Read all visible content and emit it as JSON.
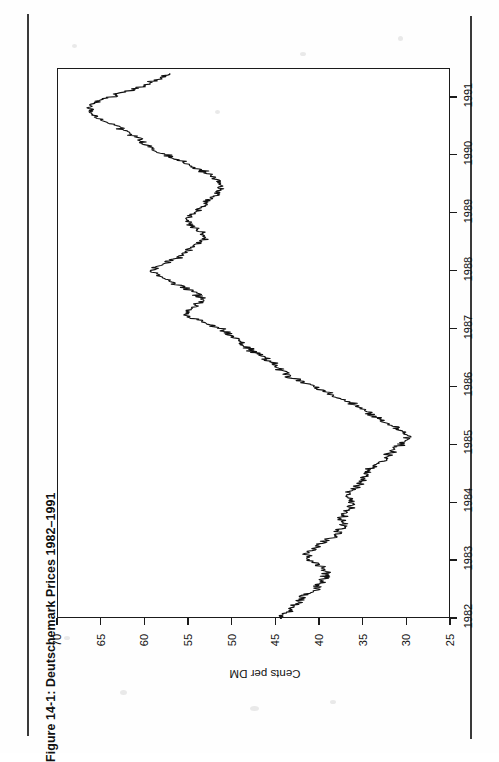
{
  "figure": {
    "title": "Figure 14-1: Deutschemark Prices 1982–1991",
    "orientation": "rotated-90-ccw",
    "page_rule_color": "#3a3a3a",
    "line_color": "#111111",
    "background": "#ffffff"
  },
  "axes": {
    "value_axis": {
      "title": "Cents per DM",
      "ticks": [
        "70",
        "65",
        "60",
        "55",
        "50",
        "45",
        "40",
        "35",
        "30",
        "25"
      ]
    },
    "time_axis": {
      "title": "",
      "ticks": [
        "1982",
        "1983",
        "1984",
        "1985",
        "1986",
        "1987",
        "1988",
        "1989",
        "1990",
        "1991"
      ]
    }
  },
  "chart_data": {
    "type": "line",
    "title": "Figure 14-1: Deutschemark Prices 1982–1991",
    "subtitle": "",
    "xlabel": "",
    "ylabel": "Cents per DM",
    "xlim": [
      1982.0,
      1991.5
    ],
    "ylim": [
      25,
      70
    ],
    "xticks": [
      1982,
      1983,
      1984,
      1985,
      1986,
      1987,
      1988,
      1989,
      1990,
      1991
    ],
    "yticks": [
      25,
      30,
      35,
      40,
      45,
      50,
      55,
      60,
      65,
      70
    ],
    "grid": false,
    "legend": "none",
    "orientation": "rotated 90° counter-clockwise; time runs bottom-to-top, price runs right-to-left",
    "series": [
      {
        "name": "Deutschemark spot price",
        "units": "US cents per Deutschemark",
        "x": [
          1982.0,
          1982.08,
          1982.17,
          1982.25,
          1982.33,
          1982.42,
          1982.5,
          1982.58,
          1982.67,
          1982.75,
          1982.83,
          1982.92,
          1983.0,
          1983.08,
          1983.17,
          1983.25,
          1983.33,
          1983.42,
          1983.5,
          1983.58,
          1983.67,
          1983.75,
          1983.83,
          1983.92,
          1984.0,
          1984.08,
          1984.17,
          1984.25,
          1984.33,
          1984.42,
          1984.5,
          1984.58,
          1984.67,
          1984.75,
          1984.83,
          1984.92,
          1985.0,
          1985.08,
          1985.17,
          1985.25,
          1985.33,
          1985.42,
          1985.5,
          1985.58,
          1985.67,
          1985.75,
          1985.83,
          1985.92,
          1986.0,
          1986.08,
          1986.17,
          1986.25,
          1986.33,
          1986.42,
          1986.5,
          1986.58,
          1986.67,
          1986.75,
          1986.83,
          1986.92,
          1987.0,
          1987.08,
          1987.17,
          1987.25,
          1987.33,
          1987.42,
          1987.5,
          1987.58,
          1987.67,
          1987.75,
          1987.83,
          1987.92,
          1988.0,
          1988.08,
          1988.17,
          1988.25,
          1988.33,
          1988.42,
          1988.5,
          1988.58,
          1988.67,
          1988.75,
          1988.83,
          1988.92,
          1989.0,
          1989.08,
          1989.17,
          1989.25,
          1989.33,
          1989.42,
          1989.5,
          1989.58,
          1989.67,
          1989.75,
          1989.83,
          1989.92,
          1990.0,
          1990.08,
          1990.17,
          1990.25,
          1990.33,
          1990.42,
          1990.5,
          1990.58,
          1990.67,
          1990.75,
          1990.83,
          1990.92,
          1991.0,
          1991.08,
          1991.17,
          1991.25,
          1991.33,
          1991.42
        ],
        "y": [
          44.6,
          44.2,
          43.4,
          42.8,
          42.4,
          41.6,
          40.6,
          40.2,
          39.8,
          39.4,
          39.2,
          40.0,
          41.0,
          41.4,
          41.2,
          40.4,
          39.6,
          38.6,
          38.0,
          37.4,
          37.0,
          37.6,
          37.2,
          36.6,
          36.2,
          36.8,
          37.0,
          36.2,
          35.4,
          35.0,
          34.6,
          34.2,
          33.4,
          32.6,
          32.2,
          31.6,
          31.0,
          30.4,
          29.8,
          30.6,
          31.6,
          32.8,
          33.8,
          34.6,
          35.6,
          36.6,
          38.2,
          39.4,
          40.4,
          41.8,
          43.2,
          44.0,
          44.8,
          45.4,
          46.2,
          47.2,
          48.2,
          49.0,
          49.6,
          50.4,
          51.2,
          52.6,
          54.2,
          55.4,
          55.0,
          54.2,
          53.4,
          53.8,
          54.6,
          55.8,
          57.2,
          58.6,
          59.4,
          58.6,
          57.4,
          56.2,
          55.4,
          54.6,
          53.8,
          53.2,
          53.6,
          54.2,
          54.8,
          55.2,
          54.6,
          53.8,
          53.2,
          52.4,
          52.0,
          51.4,
          51.0,
          51.6,
          52.4,
          53.6,
          54.8,
          56.0,
          57.4,
          58.8,
          59.6,
          60.4,
          61.2,
          62.0,
          63.2,
          64.4,
          65.4,
          66.2,
          66.6,
          65.8,
          64.4,
          62.8,
          61.0,
          59.6,
          58.4,
          57.2
        ]
      }
    ],
    "annotations": [
      {
        "text": "peak ≈ 66¢ in late 1990",
        "x": 1990.83,
        "y": 66.6
      },
      {
        "text": "trough ≈ 30¢ in early 1985",
        "x": 1985.17,
        "y": 29.8
      }
    ]
  }
}
